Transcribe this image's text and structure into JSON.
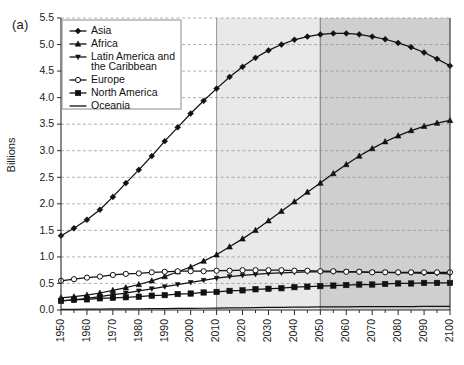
{
  "panel": {
    "label": "(a)"
  },
  "axes": {
    "ylabel": "Billions",
    "yticks": [
      "0.0",
      "0.5",
      "1.0",
      "1.5",
      "2.0",
      "2.5",
      "3.0",
      "3.5",
      "4.0",
      "4.5",
      "5.0",
      "5.5"
    ],
    "ylim": [
      0.0,
      5.5
    ],
    "xticks": [
      "1950",
      "1960",
      "1970",
      "1980",
      "1990",
      "2000",
      "2010",
      "2020",
      "2030",
      "2040",
      "2050",
      "2060",
      "2070",
      "2080",
      "2090",
      "2100"
    ],
    "xlim": [
      1950,
      2100
    ],
    "grid": true
  },
  "bands": [
    {
      "name": "projection-near",
      "from": 2010,
      "to": 2050,
      "color": "#e9e9e9"
    },
    {
      "name": "projection-far",
      "from": 2050,
      "to": 2100,
      "color": "#cfcfcf"
    }
  ],
  "legend": {
    "position": "top-left",
    "items": [
      {
        "label": "Asia",
        "marker": "diamond"
      },
      {
        "label": "Africa",
        "marker": "triangle-up"
      },
      {
        "label": "Latin America and\nthe Caribbean",
        "marker": "triangle-down"
      },
      {
        "label": "Europe",
        "marker": "circle-open"
      },
      {
        "label": "North America",
        "marker": "square"
      },
      {
        "label": "Oceania",
        "marker": "line"
      }
    ]
  },
  "chart_data": {
    "type": "line",
    "title": "",
    "xlabel": "",
    "ylabel": "Billions",
    "xlim": [
      1950,
      2100
    ],
    "ylim": [
      0.0,
      5.5
    ],
    "grid": true,
    "legend_position": "top-left",
    "x": [
      1950,
      1955,
      1960,
      1965,
      1970,
      1975,
      1980,
      1985,
      1990,
      1995,
      2000,
      2005,
      2010,
      2015,
      2020,
      2025,
      2030,
      2035,
      2040,
      2045,
      2050,
      2055,
      2060,
      2065,
      2070,
      2075,
      2080,
      2085,
      2090,
      2095,
      2100
    ],
    "series": [
      {
        "name": "Asia",
        "marker": "diamond",
        "values": [
          1.4,
          1.54,
          1.7,
          1.89,
          2.13,
          2.39,
          2.64,
          2.9,
          3.18,
          3.44,
          3.7,
          3.94,
          4.17,
          4.39,
          4.58,
          4.75,
          4.89,
          5.0,
          5.09,
          5.15,
          5.19,
          5.21,
          5.21,
          5.19,
          5.15,
          5.1,
          5.03,
          4.95,
          4.85,
          4.73,
          4.6
        ]
      },
      {
        "name": "Africa",
        "marker": "triangle-up",
        "values": [
          0.23,
          0.25,
          0.28,
          0.32,
          0.37,
          0.42,
          0.48,
          0.55,
          0.63,
          0.72,
          0.81,
          0.92,
          1.04,
          1.19,
          1.34,
          1.5,
          1.68,
          1.86,
          2.04,
          2.22,
          2.39,
          2.57,
          2.74,
          2.9,
          3.04,
          3.17,
          3.28,
          3.38,
          3.46,
          3.52,
          3.57
        ]
      },
      {
        "name": "Latin America and the Caribbean",
        "marker": "triangle-down",
        "values": [
          0.17,
          0.19,
          0.22,
          0.25,
          0.29,
          0.32,
          0.36,
          0.4,
          0.44,
          0.48,
          0.52,
          0.56,
          0.6,
          0.63,
          0.65,
          0.67,
          0.69,
          0.7,
          0.71,
          0.72,
          0.72,
          0.72,
          0.72,
          0.72,
          0.71,
          0.71,
          0.7,
          0.7,
          0.69,
          0.69,
          0.68
        ]
      },
      {
        "name": "Europe",
        "marker": "circle-open",
        "values": [
          0.55,
          0.58,
          0.61,
          0.63,
          0.66,
          0.68,
          0.69,
          0.71,
          0.72,
          0.73,
          0.73,
          0.73,
          0.74,
          0.74,
          0.75,
          0.75,
          0.75,
          0.75,
          0.74,
          0.74,
          0.73,
          0.73,
          0.72,
          0.72,
          0.71,
          0.71,
          0.71,
          0.71,
          0.71,
          0.71,
          0.71
        ]
      },
      {
        "name": "North America",
        "marker": "square",
        "values": [
          0.17,
          0.19,
          0.2,
          0.22,
          0.23,
          0.24,
          0.25,
          0.27,
          0.28,
          0.3,
          0.31,
          0.33,
          0.34,
          0.36,
          0.37,
          0.39,
          0.4,
          0.41,
          0.43,
          0.44,
          0.45,
          0.46,
          0.47,
          0.48,
          0.48,
          0.49,
          0.5,
          0.5,
          0.51,
          0.51,
          0.51
        ]
      },
      {
        "name": "Oceania",
        "marker": "line",
        "values": [
          0.013,
          0.014,
          0.016,
          0.017,
          0.019,
          0.021,
          0.023,
          0.025,
          0.027,
          0.029,
          0.031,
          0.033,
          0.037,
          0.039,
          0.042,
          0.045,
          0.048,
          0.05,
          0.053,
          0.055,
          0.057,
          0.059,
          0.06,
          0.062,
          0.063,
          0.064,
          0.065,
          0.066,
          0.067,
          0.068,
          0.069
        ]
      }
    ]
  }
}
